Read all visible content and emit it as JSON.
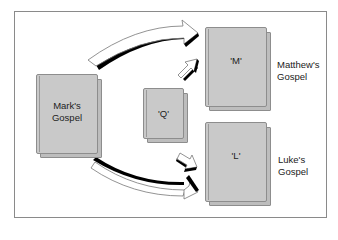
{
  "diagram": {
    "type": "synoptic-problem-four-source-hypothesis",
    "books": {
      "mark": {
        "label_line1": "Mark's",
        "label_line2": "Gospel"
      },
      "q": {
        "label": "'Q'"
      },
      "m": {
        "label": "'M'"
      },
      "l": {
        "label": "'L'"
      }
    },
    "side_labels": {
      "matthew": {
        "line1": "Matthew's",
        "line2": "Gospel"
      },
      "luke": {
        "line1": "Luke's",
        "line2": "Gospel"
      }
    },
    "arrows": [
      {
        "from": "Mark's Gospel",
        "to": "Matthew's Gospel"
      },
      {
        "from": "'Q'",
        "to": "Matthew's Gospel"
      },
      {
        "from": "'Q'",
        "to": "Luke's Gospel"
      },
      {
        "from": "Mark's Gospel",
        "to": "Luke's Gospel"
      }
    ],
    "colors": {
      "book_fill": "#c9c9c9",
      "book_edge": "#8d8d8d",
      "arrow_fill": "#ffffff",
      "arrow_shadow": "#000000",
      "frame": "#8a8a8a"
    }
  }
}
